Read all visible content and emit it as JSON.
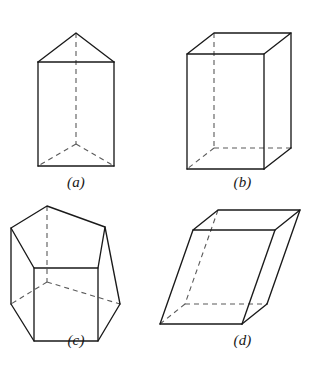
{
  "plate": {
    "title": "Prisms",
    "background_color": "#ffffff",
    "line_color": "#1a1a1a",
    "hidden_line_color": "#5a5a5a",
    "width": 325,
    "height": 374
  },
  "figures": [
    {
      "id": "a",
      "caption": "(a)",
      "name": "triangular-prism",
      "description": "Right triangular prism standing upright, apex of the top triangle at the rear",
      "base_sides": 3,
      "orientation": "upright",
      "visible_vertices": 6
    },
    {
      "id": "b",
      "caption": "(b)",
      "name": "rectangular-prism",
      "description": "Right rectangular prism (cuboid) drawn in oblique projection",
      "base_sides": 4,
      "orientation": "upright",
      "visible_vertices": 8
    },
    {
      "id": "c",
      "caption": "(c)",
      "name": "pentagonal-prism",
      "description": "Right pentagonal prism seen slightly from above",
      "base_sides": 5,
      "orientation": "upright",
      "visible_vertices": 10
    },
    {
      "id": "d",
      "caption": "(d)",
      "name": "oblique-prism",
      "description": "Oblique rectangular prism (slanted parallelepiped)",
      "base_sides": 4,
      "orientation": "oblique",
      "visible_vertices": 8
    }
  ]
}
